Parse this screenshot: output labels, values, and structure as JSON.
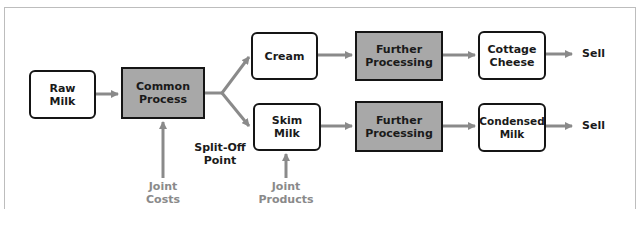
{
  "diagram": {
    "colors": {
      "box_border": "#151515",
      "process_fill": "#a8a8a8",
      "arrow": "#8a8a8a",
      "side_label": "#8a8a8a",
      "frame": "#bdbdbd"
    },
    "nodes": {
      "raw_milk": "Raw\nMilk",
      "common_process": "Common\nProcess",
      "cream": "Cream",
      "skim_milk": "Skim\nMilk",
      "further_processing_1": "Further\nProcessing",
      "further_processing_2": "Further\nProcessing",
      "cottage_cheese": "Cottage\nCheese",
      "condensed_milk": "Condensed\nMilk"
    },
    "labels": {
      "sell_1": "Sell",
      "sell_2": "Sell",
      "split_off_point": "Split-Off\nPoint",
      "joint_costs": "Joint\nCosts",
      "joint_products": "Joint\nProducts"
    },
    "edges": [
      {
        "from": "Raw Milk",
        "to": "Common Process"
      },
      {
        "from": "Common Process",
        "to": "Cream"
      },
      {
        "from": "Common Process",
        "to": "Skim Milk"
      },
      {
        "from": "Cream",
        "to": "Further Processing"
      },
      {
        "from": "Skim Milk",
        "to": "Further Processing"
      },
      {
        "from": "Further Processing",
        "to": "Cottage Cheese"
      },
      {
        "from": "Further Processing",
        "to": "Condensed Milk"
      },
      {
        "from": "Cottage Cheese",
        "to": "Sell"
      },
      {
        "from": "Condensed Milk",
        "to": "Sell"
      },
      {
        "from": "Joint Costs",
        "to": "Common Process"
      },
      {
        "from": "Joint Products",
        "to": "Skim Milk"
      }
    ]
  }
}
